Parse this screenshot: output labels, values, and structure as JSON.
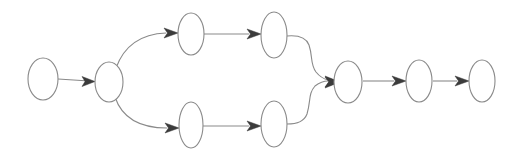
{
  "diagram": {
    "background_color": "#ffffff",
    "node_stroke_color": "#8a8a8a",
    "node_fill_color": "#ffffff",
    "edge_stroke_color": "#8a8a8a",
    "arrowhead_color": "#3b3b3b",
    "node_count": "9",
    "edge_count": "10",
    "shape": "ellipse",
    "nodes": [
      {
        "id": "n1",
        "label": "",
        "cx": 43,
        "cy": 79,
        "rx": 15,
        "ry": 21
      },
      {
        "id": "n2",
        "label": "",
        "cx": 109,
        "cy": 82,
        "rx": 14,
        "ry": 20
      },
      {
        "id": "n3",
        "label": "",
        "cx": 191,
        "cy": 34,
        "rx": 13,
        "ry": 21
      },
      {
        "id": "n4",
        "label": "",
        "cx": 274,
        "cy": 35,
        "rx": 13,
        "ry": 23
      },
      {
        "id": "n5",
        "label": "",
        "cx": 191,
        "cy": 125,
        "rx": 12,
        "ry": 23
      },
      {
        "id": "n6",
        "label": "",
        "cx": 274,
        "cy": 124,
        "rx": 13,
        "ry": 23
      },
      {
        "id": "n7",
        "label": "",
        "cx": 348,
        "cy": 82,
        "rx": 14,
        "ry": 21
      },
      {
        "id": "n8",
        "label": "",
        "cx": 419,
        "cy": 81,
        "rx": 13,
        "ry": 21
      },
      {
        "id": "n9",
        "label": "",
        "cx": 482,
        "cy": 81,
        "rx": 13,
        "ry": 21
      }
    ],
    "edges": [
      {
        "id": "e1",
        "from": "n1",
        "to": "n2",
        "kind": "straight"
      },
      {
        "id": "e2",
        "from": "n2",
        "to": "n3",
        "kind": "curve-up"
      },
      {
        "id": "e3",
        "from": "n2",
        "to": "n5",
        "kind": "curve-down"
      },
      {
        "id": "e4",
        "from": "n3",
        "to": "n4",
        "kind": "straight"
      },
      {
        "id": "e5",
        "from": "n5",
        "to": "n6",
        "kind": "straight"
      },
      {
        "id": "e6",
        "from": "n4",
        "to": "n7",
        "kind": "curve-down"
      },
      {
        "id": "e7",
        "from": "n6",
        "to": "n7",
        "kind": "curve-up"
      },
      {
        "id": "e8",
        "from": "n7",
        "to": "n8",
        "kind": "straight"
      },
      {
        "id": "e9",
        "from": "n8",
        "to": "n9",
        "kind": "straight"
      }
    ]
  }
}
